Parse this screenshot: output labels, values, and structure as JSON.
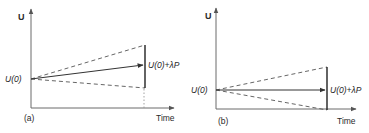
{
  "panels": [
    {
      "id": "a",
      "caption": "(a)",
      "y_axis_label": "U",
      "x_axis_label": "Time",
      "start_label": "U(0)",
      "end_label": "U(0)+λP",
      "description": "Solid arrow rising from U(0) to U(0)+λP; dashed envelope lines diverge up and down; vertical bar spans envelope at final time; dotted line drops to time axis"
    },
    {
      "id": "b",
      "caption": "(b)",
      "y_axis_label": "U",
      "x_axis_label": "Time",
      "start_label": "U(0)",
      "end_label": "U(0)+λP",
      "description": "Horizontal solid arrow from U(0) to U(0)+λP; dashed envelope lines diverge up and down to the time axis; vertical bar spans envelope at final time"
    }
  ],
  "colors": {
    "ink": "#2a2a2a",
    "axis": "#6b6b6b",
    "background": "#ffffff"
  }
}
